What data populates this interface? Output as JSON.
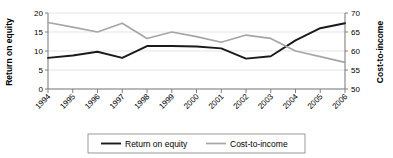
{
  "chart_data": {
    "type": "line",
    "title": "",
    "xlabel": "",
    "categories": [
      "1994",
      "1995",
      "1996",
      "1997",
      "1998",
      "1999",
      "2000",
      "2001",
      "2002",
      "2003",
      "2004",
      "2005",
      "2006"
    ],
    "grid": true,
    "legend_position": "bottom",
    "axes": {
      "left": {
        "label": "Return on equity",
        "ticks": [
          0,
          5,
          10,
          15,
          20
        ],
        "ylim": [
          0,
          20
        ]
      },
      "right": {
        "label": "Cost-to-income",
        "ticks": [
          50,
          55,
          60,
          65,
          70
        ],
        "ylim": [
          50,
          70
        ]
      }
    },
    "series": [
      {
        "name": "Return on equity",
        "axis": "left",
        "color": "#1a1a1a",
        "width": 1.9,
        "values": [
          8.2,
          8.8,
          9.8,
          8.2,
          11.3,
          11.3,
          11.2,
          10.7,
          8.0,
          8.6,
          12.8,
          16.0,
          17.3
        ]
      },
      {
        "name": "Cost-to-income",
        "axis": "right",
        "color": "#a6a6a6",
        "width": 1.7,
        "values": [
          67.5,
          66.3,
          65.0,
          67.3,
          63.3,
          65.0,
          63.8,
          62.3,
          64.2,
          63.3,
          60.0,
          58.5,
          57.0
        ]
      }
    ]
  },
  "legend": {
    "items": [
      {
        "label": "Return on equity",
        "color": "#1a1a1a"
      },
      {
        "label": "Cost-to-income",
        "color": "#a6a6a6"
      }
    ]
  }
}
